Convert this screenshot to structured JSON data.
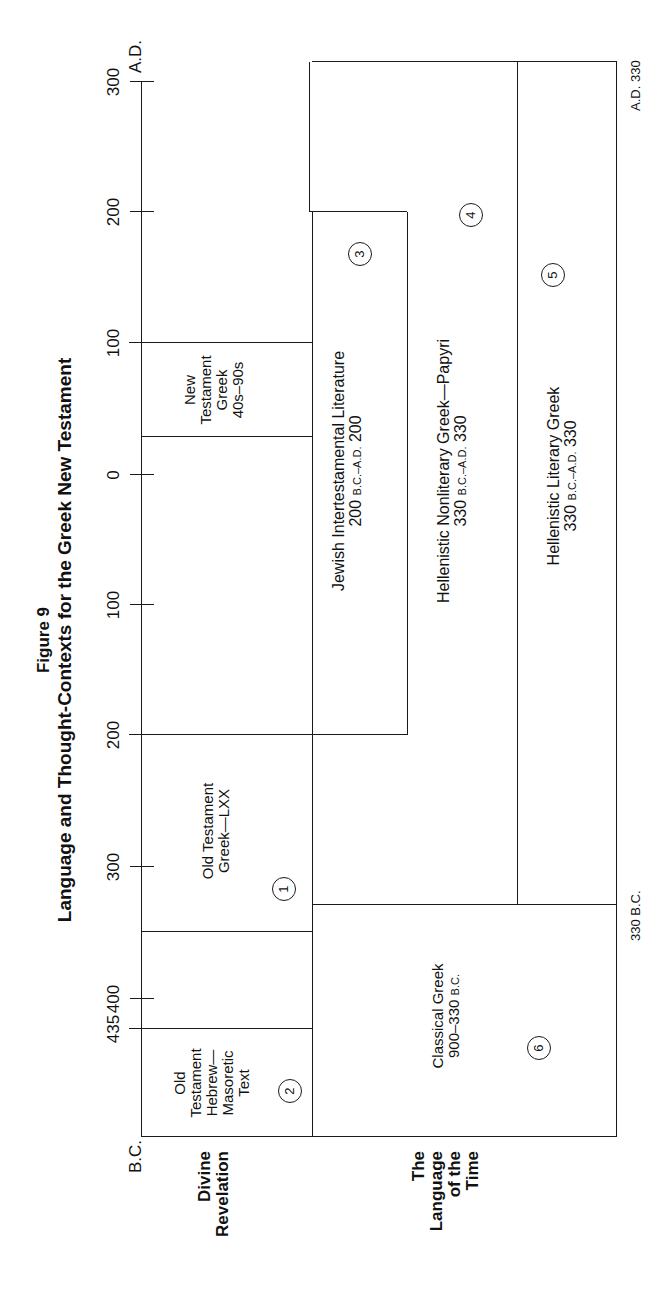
{
  "figure": {
    "number": "Figure 9",
    "title": "Language and Thought-Contexts for the Greek New Testament"
  },
  "axis": {
    "left_era": "B.C.",
    "right_era": "A.D.",
    "ticks": [
      {
        "label": "435",
        "era": "B.C."
      },
      {
        "label": "400",
        "era": "B.C."
      },
      {
        "label": "300",
        "era": "B.C."
      },
      {
        "label": "200",
        "era": "B.C."
      },
      {
        "label": "100",
        "era": "B.C."
      },
      {
        "label": "0",
        "era": ""
      },
      {
        "label": "100",
        "era": "A.D."
      },
      {
        "label": "200",
        "era": "A.D."
      },
      {
        "label": "300",
        "era": "A.D."
      }
    ]
  },
  "rows": {
    "divine": "Divine Revelation",
    "divine_line1": "Divine",
    "divine_line2": "Revelation",
    "time_line1": "The",
    "time_line2": "Language",
    "time_line3": "of the",
    "time_line4": "Time"
  },
  "boxes": [
    {
      "id": "1",
      "lines": [
        "Old Testament",
        "Greek—LXX"
      ],
      "range": "",
      "circle": "1"
    },
    {
      "id": "2",
      "lines": [
        "Old",
        "Testament",
        "Hebrew—",
        "Masoretic",
        "Text"
      ],
      "range": "",
      "circle": "2"
    },
    {
      "id": "3",
      "title": "Jewish Intertestamental Literature",
      "range_num": "200",
      "range_sc": "B.C.–A.D.",
      "range_end": "200",
      "circle": "3"
    },
    {
      "id": "4",
      "title": "Hellenistic Nonliterary Greek—Papyri",
      "range_num": "330",
      "range_sc": "B.C.–A.D.",
      "range_end": "330",
      "circle": "4"
    },
    {
      "id": "5",
      "title": "Hellenistic Literary Greek",
      "range_num": "330",
      "range_sc": "B.C.–A.D.",
      "range_end": "330",
      "circle": "5"
    },
    {
      "id": "6",
      "title": "Classical Greek",
      "range_num": "900–330",
      "range_sc": "B.C.",
      "range_end": "",
      "circle": "6"
    },
    {
      "id": "nt",
      "lines": [
        "New",
        "Testament",
        "Greek",
        "40s–90s"
      ]
    }
  ],
  "edge_labels": {
    "bc330_num": "330",
    "bc330_sc": "B.C.",
    "ad330_sc": "A.D.",
    "ad330_num": "330"
  }
}
